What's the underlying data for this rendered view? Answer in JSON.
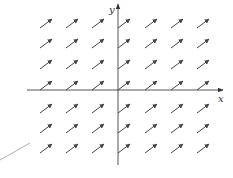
{
  "diagram": {
    "type": "direction_field",
    "axes": {
      "x_label": "x",
      "y_label": "y",
      "origin": [
        118,
        90
      ],
      "x_axis": {
        "from": [
          27,
          90
        ],
        "to": [
          223,
          90
        ]
      },
      "y_axis": {
        "from": [
          118,
          165
        ],
        "to": [
          118,
          4
        ]
      }
    },
    "arrow_color": "#444444",
    "axis_color": "#555555",
    "arrow": {
      "dx": 12,
      "dy": -9
    },
    "columns_x": [
      40,
      66,
      92,
      118,
      145,
      171,
      197
    ],
    "rows_y": [
      28,
      48,
      69,
      90,
      113,
      133,
      153
    ],
    "annotation_line": {
      "from": [
        0,
        160
      ],
      "to": [
        30,
        143
      ],
      "color": "#999999"
    }
  }
}
